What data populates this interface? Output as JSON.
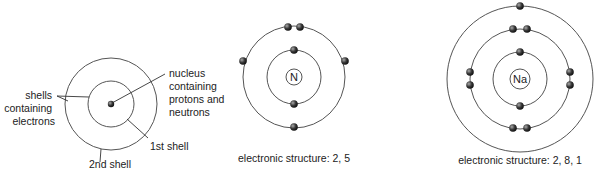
{
  "diagram": {
    "generic_atom": {
      "labels": {
        "shells": [
          "shells",
          "containing",
          "electrons"
        ],
        "nucleus": [
          "nucleus",
          "containing",
          "protons and",
          "neutrons"
        ],
        "first_shell": "1st shell",
        "second_shell": "2nd shell"
      }
    },
    "nitrogen": {
      "symbol": "N",
      "caption": "electronic structure: 2, 5",
      "shells": [
        2,
        5
      ]
    },
    "sodium": {
      "symbol": "Na",
      "caption": "electronic structure: 2, 8, 1",
      "shells": [
        2,
        8,
        1
      ]
    },
    "colors": {
      "line": "#555555",
      "electron": "#333333",
      "text": "#222222"
    }
  }
}
